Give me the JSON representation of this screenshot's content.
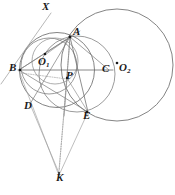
{
  "figure": {
    "width": 175,
    "height": 195,
    "background": "#ffffff",
    "stroke_color": "#4a4a4a",
    "stroke_color_light": "#8a8a8a",
    "label_color": "#1a1a1a"
  },
  "labels": {
    "X": "X",
    "A": "A",
    "B": "B",
    "C": "C",
    "D": "D",
    "E": "E",
    "K": "K",
    "P": "P",
    "O1_base": "O",
    "O1_sub": "1",
    "O2_base": "O",
    "O2_sub": "2"
  },
  "points": {
    "X": {
      "x": 47,
      "y": 8,
      "label_x": 42,
      "label_y": 2
    },
    "A": {
      "x": 70,
      "y": 37,
      "label_x": 73,
      "label_y": 26
    },
    "B": {
      "x": 20,
      "y": 70,
      "label_x": 11,
      "label_y": 62
    },
    "C": {
      "x": 108,
      "y": 70,
      "label_x": 104,
      "label_y": 63
    },
    "D": {
      "x": 30,
      "y": 104,
      "label_x": 25,
      "label_y": 101
    },
    "E": {
      "x": 87,
      "y": 112,
      "label_x": 84,
      "label_y": 110
    },
    "K": {
      "x": 59,
      "y": 174,
      "label_x": 57,
      "label_y": 172
    },
    "P": {
      "x": 67,
      "y": 78,
      "label_x": 67,
      "label_y": 70
    },
    "O1": {
      "x": 45,
      "y": 54,
      "label_x": 38,
      "label_y": 57
    },
    "O2": {
      "x": 117,
      "y": 63,
      "label_x": 120,
      "label_y": 62
    }
  },
  "circles": [
    {
      "name": "circle-O2-large",
      "cx": 117,
      "cy": 65,
      "r": 56
    },
    {
      "name": "circle-O1-main",
      "cx": 57,
      "cy": 70,
      "r": 38
    },
    {
      "name": "circle-ABPE-small",
      "cx": 48,
      "cy": 66,
      "r": 28
    },
    {
      "name": "circle-APCE",
      "cx": 78,
      "cy": 75,
      "r": 38
    },
    {
      "name": "circle-through-A-P-B",
      "cx": 53,
      "cy": 63,
      "r": 24
    }
  ],
  "lines": [
    {
      "name": "line-B-C-diameter",
      "x1": 20,
      "y1": 70,
      "x2": 112,
      "y2": 70
    },
    {
      "name": "line-X-through-A-to-lowerleft",
      "x1": 50,
      "y1": 12,
      "x2": 0,
      "y2": 83
    },
    {
      "name": "line-A-B",
      "x1": 70,
      "y1": 37,
      "x2": 20,
      "y2": 70
    },
    {
      "name": "line-A-D",
      "x1": 70,
      "y1": 37,
      "x2": 30,
      "y2": 104
    },
    {
      "name": "line-A-E",
      "x1": 70,
      "y1": 37,
      "x2": 87,
      "y2": 112
    },
    {
      "name": "line-A-P-K",
      "x1": 70,
      "y1": 37,
      "x2": 59,
      "y2": 174
    },
    {
      "name": "line-A-C",
      "x1": 70,
      "y1": 37,
      "x2": 108,
      "y2": 70
    },
    {
      "name": "line-B-E",
      "x1": 20,
      "y1": 70,
      "x2": 87,
      "y2": 112
    },
    {
      "name": "line-B-A-extended",
      "x1": 20,
      "y1": 70,
      "x2": 78,
      "y2": 32
    },
    {
      "name": "line-D-K",
      "x1": 30,
      "y1": 104,
      "x2": 59,
      "y2": 174
    },
    {
      "name": "line-E-K",
      "x1": 87,
      "y1": 112,
      "x2": 59,
      "y2": 174
    },
    {
      "name": "line-K-A-dotted",
      "x1": 59,
      "y1": 174,
      "x2": 70,
      "y2": 37
    },
    {
      "name": "line-B-P-dotted",
      "x1": 20,
      "y1": 72,
      "x2": 67,
      "y2": 78
    },
    {
      "name": "line-P-E",
      "x1": 67,
      "y1": 78,
      "x2": 87,
      "y2": 112
    },
    {
      "name": "line-O1-A",
      "x1": 45,
      "y1": 54,
      "x2": 70,
      "y2": 37
    },
    {
      "name": "line-K-B",
      "x1": 59,
      "y1": 174,
      "x2": 20,
      "y2": 70
    }
  ]
}
